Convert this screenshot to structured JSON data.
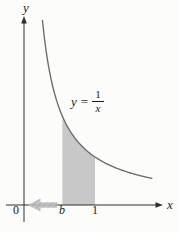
{
  "figure": {
    "background": "#fcfcfb",
    "axis_color": "#2f2f2f",
    "curve_color": "#6e6e6e",
    "region_color": "#c8c8c8",
    "arrow_fill": "#bfbfbf",
    "arrow_hatch": "#9a9a9a",
    "labels": {
      "y_axis": "y",
      "x_axis": "x",
      "origin": "0",
      "b_tick": "b",
      "one_tick": "1"
    },
    "equation": {
      "lhs": "y",
      "equals": "=",
      "numerator": "1",
      "denominator": "x"
    }
  },
  "chart_data": {
    "type": "line",
    "title": "",
    "xlabel": "x",
    "ylabel": "y",
    "function": "y = 1/x",
    "x_range": [
      0.26,
      1.8
    ],
    "ylim": [
      0,
      4.2
    ],
    "grid": false,
    "x_ticks": [
      {
        "value": 0,
        "label": "0"
      },
      {
        "value": 0.54,
        "label": "b"
      },
      {
        "value": 1,
        "label": "1"
      }
    ],
    "shaded_region": {
      "under_curve": "y = 1/x",
      "from_label": "b",
      "from_value": 0.54,
      "to_value": 1
    },
    "annotations": [
      {
        "type": "arrow",
        "meaning": "b approaches 0 from the right",
        "from_x": 0.47,
        "to_x": 0.05,
        "at_y": 0
      },
      {
        "type": "text",
        "text": "y = 1/x",
        "near_x": 0.85,
        "near_y": 2.1
      }
    ],
    "sample_points": [
      [
        0.26,
        3.846
      ],
      [
        0.3,
        3.333
      ],
      [
        0.35,
        2.857
      ],
      [
        0.4,
        2.5
      ],
      [
        0.5,
        2.0
      ],
      [
        0.54,
        1.852
      ],
      [
        0.6,
        1.667
      ],
      [
        0.7,
        1.429
      ],
      [
        0.85,
        1.176
      ],
      [
        1.0,
        1.0
      ],
      [
        1.2,
        0.833
      ],
      [
        1.4,
        0.714
      ],
      [
        1.6,
        0.625
      ],
      [
        1.8,
        0.556
      ]
    ]
  }
}
